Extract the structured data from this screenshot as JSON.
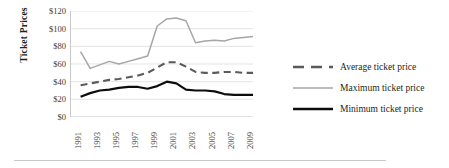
{
  "chart_data": {
    "type": "line",
    "title": "",
    "xlabel": "",
    "ylabel": "Ticket Prices",
    "ylim": [
      0,
      120
    ],
    "ytick_values": [
      120,
      100,
      80,
      60,
      40,
      20,
      0
    ],
    "ytick_labels": [
      "$120",
      "$100",
      "$80",
      "$60",
      "$40",
      "$20",
      "$0"
    ],
    "grid": true,
    "legend_position": "right",
    "x": [
      1991,
      1992,
      1993,
      1994,
      1995,
      1996,
      1997,
      1998,
      1999,
      2000,
      2001,
      2002,
      2003,
      2004,
      2005,
      2006,
      2007,
      2008,
      2009,
      2010
    ],
    "xtick_labels": [
      "1991",
      "1993",
      "1995",
      "1997",
      "1999",
      "2001",
      "2003",
      "2005",
      "2007",
      "2009"
    ],
    "xtick_values": [
      1991,
      1993,
      1995,
      1997,
      1999,
      2001,
      2003,
      2005,
      2007,
      2009
    ],
    "series": [
      {
        "name": "Average ticket price",
        "style": "dashed",
        "color": "#5a5a5a",
        "values": [
          null,
          36,
          38,
          40,
          42,
          43,
          45,
          47,
          50,
          56,
          62,
          62,
          57,
          51,
          50,
          50,
          51,
          51,
          50,
          50
        ]
      },
      {
        "name": "Maximum ticket price",
        "style": "solid-light",
        "color": "#a6a6a6",
        "values": [
          null,
          74,
          55,
          59,
          63,
          60,
          63,
          66,
          69,
          103,
          111,
          112,
          109,
          84,
          86,
          87,
          86,
          89,
          90,
          91
        ]
      },
      {
        "name": "Minimum ticket price",
        "style": "solid-bold",
        "color": "#0d0d0d",
        "values": [
          null,
          23,
          27,
          30,
          31,
          33,
          34,
          34,
          32,
          35,
          40,
          38,
          31,
          30,
          30,
          29,
          26,
          25,
          25,
          25
        ]
      }
    ]
  },
  "legend": {
    "items": [
      {
        "label": "Average ticket price",
        "swatch": "dashed-line-swatch"
      },
      {
        "label": "Maximum ticket price",
        "swatch": "light-line-swatch"
      },
      {
        "label": "Minimum ticket price",
        "swatch": "bold-line-swatch"
      }
    ]
  },
  "axis": {
    "y_title": "Ticket Prices"
  }
}
